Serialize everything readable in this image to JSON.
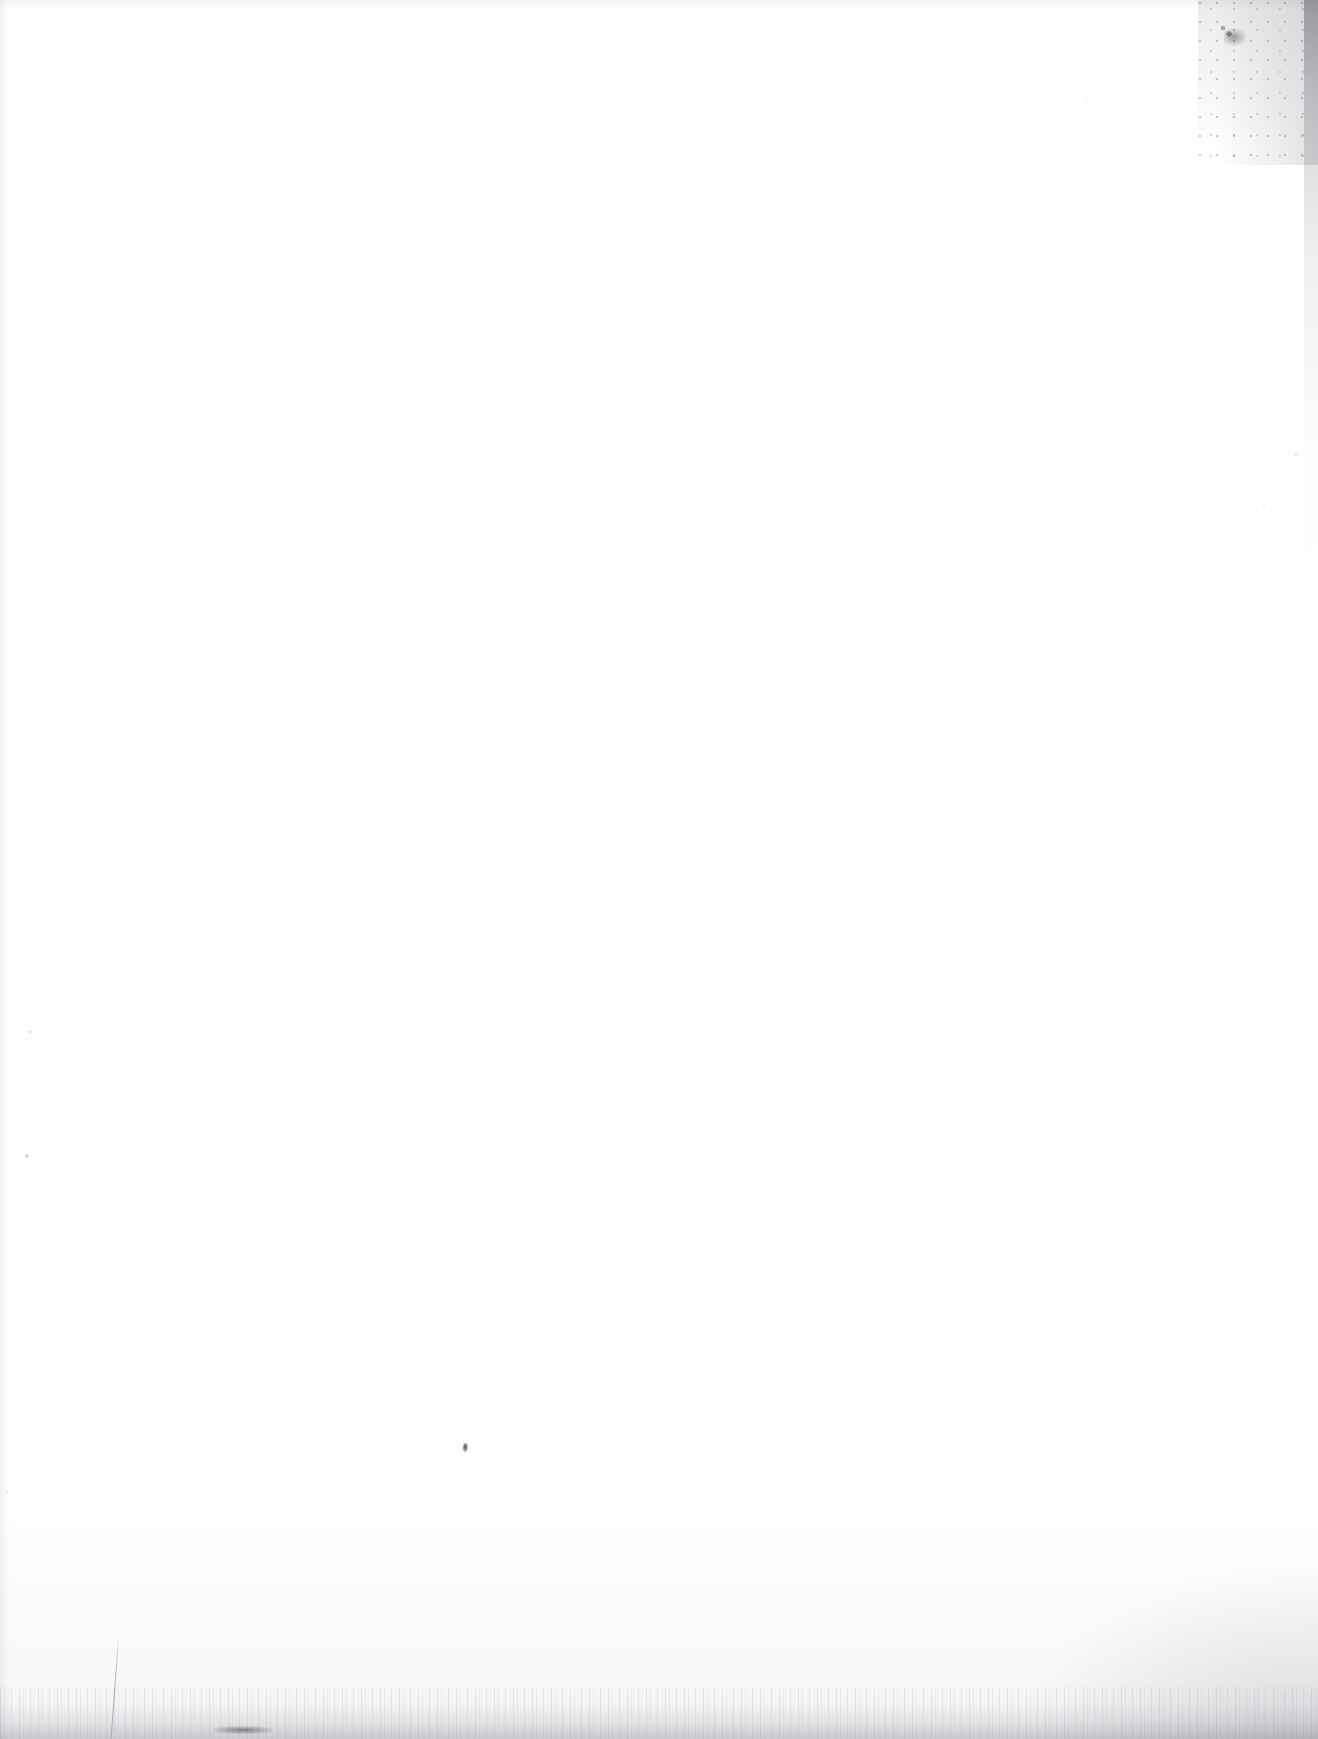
{
  "page": {
    "kind": "blank-scanned-page",
    "width": 1318,
    "height": 1739,
    "background_color": "#ffffff",
    "visible_text": "",
    "text_content_present": false,
    "note": ""
  },
  "artifacts": {
    "paper_tone": "#ffffff",
    "noise_tone": "#8a8a92",
    "edge_tone": "#9a9aa2",
    "ink_tone": "#373740",
    "items": [
      {
        "name": "top-right-noise-cloud",
        "description": "dense gray speckle cloud in the upper right corner",
        "x": 1198,
        "y": 0,
        "width": 120,
        "height": 165
      },
      {
        "name": "top-right-smudge",
        "description": "concentrated dark smudge cluster",
        "x": 1224,
        "y": 28,
        "width": 22,
        "height": 18
      },
      {
        "name": "right-edge-strip",
        "description": "thin darker vertical strip along the right edge fading downward",
        "x": 1304,
        "y": 0,
        "width": 14,
        "height": 620
      },
      {
        "name": "bottom-edge-band",
        "description": "faint gray noisy band with vertical striations across the full bottom edge",
        "x": 0,
        "y": 1687,
        "width": 1318,
        "height": 52
      },
      {
        "name": "bottom-left-speckle",
        "description": "speckle field in the lower left",
        "x": 95,
        "y": 1629,
        "width": 250,
        "height": 110
      },
      {
        "name": "bottom-right-speckle",
        "description": "gray speckle cloud intensifying toward the bottom right corner",
        "x": 1028,
        "y": 1564,
        "width": 290,
        "height": 175
      },
      {
        "name": "scratch-line",
        "description": "thin near-vertical scratch running to the bottom left edge",
        "x": 118,
        "y": 1638,
        "width": 9,
        "height": 101
      },
      {
        "name": "bottom-blob",
        "description": "dark horizontal blob at the very bottom left",
        "x": 214,
        "y": 1726,
        "width": 58,
        "height": 8
      },
      {
        "name": "ink-speck",
        "description": "single small dark ink speck on the open paper field",
        "x": 463,
        "y": 1443,
        "width": 5,
        "height": 9
      }
    ]
  }
}
